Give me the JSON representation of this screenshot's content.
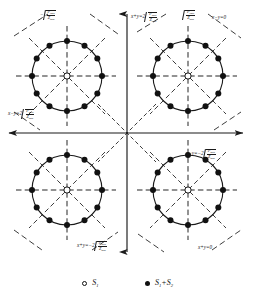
{
  "figure": {
    "type": "constellation-phase-diagram",
    "quadrant_count": 4,
    "dots_per_circle": 12,
    "center_symbol": "open-circle"
  },
  "axes": {
    "horizontal": {
      "name": "x-axis",
      "arrow": "right"
    },
    "vertical": {
      "name": "y-axis",
      "arrow": "up"
    }
  },
  "radicand": {
    "numerator": "P",
    "numerator_sub": "ipsk",
    "denominator": "Z",
    "denominator_sub": "ipsk"
  },
  "labels": {
    "top_left": {
      "prefix": "−",
      "has_sqrt": true,
      "num": "P",
      "num_sub": "ipsk",
      "den": "Z",
      "den_sub": "ipsk"
    },
    "top_center": {
      "prefix": "x+y=2",
      "has_sqrt": true,
      "num": "P",
      "num_sub": "ipsk",
      "den": "Z",
      "den_sub": "ipsk"
    },
    "top_right_sqrt": {
      "prefix": "",
      "has_sqrt": true,
      "num": "P",
      "num_sub": "ipsk",
      "den": "Z",
      "den_sub": "ipsk"
    },
    "top_right_eq": {
      "text": "x−y=0"
    },
    "left_mid": {
      "prefix": "x−y=2",
      "has_sqrt": true,
      "num": "P",
      "num_sub": "ipsk",
      "den": "Z",
      "den_sub": "ipsk"
    },
    "right_mid": {
      "prefix": "x−y=−2",
      "has_sqrt": true,
      "num": "P",
      "num_sub": "ipsk",
      "den": "Z",
      "den_sub": "ipsk"
    },
    "bottom_center": {
      "prefix": "x+y=−2",
      "has_sqrt": true,
      "num": "P",
      "num_sub": "ipsk",
      "den": "Z",
      "den_sub": "ipsk"
    },
    "bottom_right_eq": {
      "text": "x+y=0"
    }
  },
  "legend": {
    "items": [
      {
        "marker": "open-circle",
        "symbol": "S",
        "subscript": "1"
      },
      {
        "marker": "filled-circle",
        "symbol": "S",
        "subscript": "1",
        "plus": "+S",
        "subscript2": "2"
      }
    ],
    "item1_label": "S",
    "item1_sub": "1",
    "item2_label": "S",
    "item2_sub1": "1",
    "item2_mid": "+S",
    "item2_sub2": "2"
  },
  "colors": {
    "stroke": "#1a1a1a",
    "dot_fill": "#111111",
    "background": "#ffffff"
  }
}
